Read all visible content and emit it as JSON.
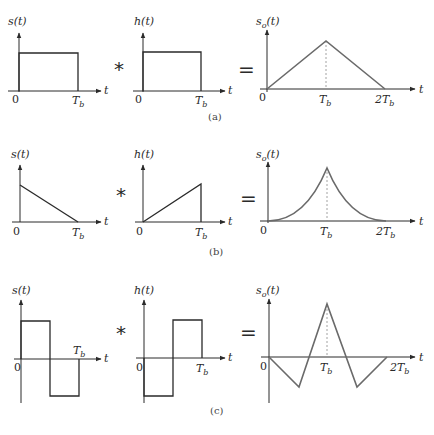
{
  "figure": {
    "operators": {
      "convolve": "*",
      "equals": "="
    },
    "axis_t_label": "t",
    "origin_label": "0",
    "tb_label": "T",
    "tb_sub": "b",
    "two_tb_prefix": "2T",
    "rows": [
      {
        "caption": "(a)",
        "input_label": "s(t)",
        "filter_label": "h(t)",
        "output_label_main": "s",
        "output_label_sub": "o",
        "output_label_arg": "(t)",
        "input_shape": "rectangular pulse 0..Tb",
        "filter_shape": "rectangular pulse 0..Tb",
        "output_shape": "triangle peaking at Tb, zero at 0 and 2Tb"
      },
      {
        "caption": "(b)",
        "input_label": "s(t)",
        "filter_label": "h(t)",
        "output_label_main": "s",
        "output_label_sub": "o",
        "output_label_arg": "(t)",
        "input_shape": "ramp down from A at 0 to 0 at Tb",
        "filter_shape": "ramp up from 0 at 0 to A at Tb",
        "output_shape": "concave-up rise to peak at Tb, concave decay to 2Tb"
      },
      {
        "caption": "(c)",
        "input_label": "s(t)",
        "filter_label": "h(t)",
        "output_label_main": "s",
        "output_label_sub": "o",
        "output_label_arg": "(t)",
        "input_shape": "+A on 0..Tb/2, -A on Tb/2..Tb",
        "filter_shape": "-A on 0..Tb/2, +A on Tb/2..Tb",
        "output_shape": "negative dip at Tb/2, positive peak at Tb, negative dip at 3Tb/2, zero at 2Tb"
      }
    ]
  }
}
